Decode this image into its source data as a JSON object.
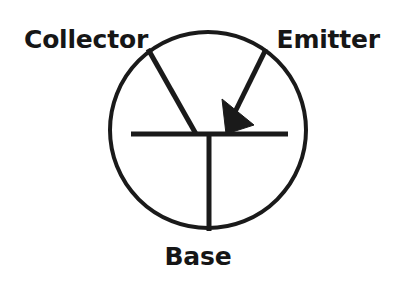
{
  "figure": {
    "kind": "pnp-bipolar-junction-transistor-symbol",
    "background_color": "#ffffff",
    "ink_color": "#1a1a1a"
  },
  "labels": {
    "collector": "Collector",
    "emitter": "Emitter",
    "base": "Base"
  },
  "diagram": {
    "envelope": {
      "shape": "circle",
      "cx": 208,
      "cy": 130,
      "r": 98,
      "stroke_width": 4
    },
    "base_bar": {
      "x1": 131,
      "y1": 134,
      "x2": 288,
      "y2": 134,
      "stroke_width": 5
    },
    "base_lead": {
      "x1": 209,
      "y1": 134,
      "x2": 209,
      "y2": 231,
      "stroke_width": 5
    },
    "collector_lead": {
      "x1": 148,
      "y1": 49,
      "x2": 196,
      "y2": 134,
      "stroke_width": 5
    },
    "emitter_lead": {
      "x1": 266,
      "y1": 49,
      "x2": 233,
      "y2": 116,
      "stroke_width": 5
    },
    "emitter_arrow": {
      "direction": "pointing-inward-toward-base",
      "points": "222,99 254,125 226,134",
      "fill": "#1a1a1a"
    }
  }
}
